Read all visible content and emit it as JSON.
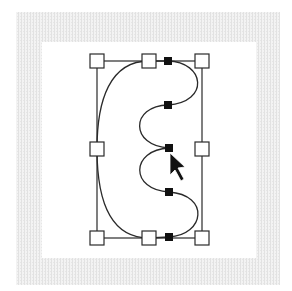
{
  "figure": {
    "colors": {
      "frame": "#ececec",
      "background": "#ffffff",
      "stroke": "#2a2a2a",
      "anchor": "#111111",
      "handle_fill": "#ffffff"
    },
    "frame": {
      "outer": [
        16,
        12,
        264,
        273
      ],
      "inner": [
        42,
        42,
        214,
        216
      ]
    },
    "bounding_box": {
      "x1": 97,
      "y1": 61,
      "x2": 202,
      "y2": 238
    },
    "handles": [
      {
        "name": "top-left",
        "x": 97,
        "y": 61
      },
      {
        "name": "top-middle",
        "x": 149,
        "y": 61
      },
      {
        "name": "top-right",
        "x": 202,
        "y": 61
      },
      {
        "name": "middle-left",
        "x": 97,
        "y": 149
      },
      {
        "name": "middle-right",
        "x": 202,
        "y": 149
      },
      {
        "name": "bottom-left",
        "x": 97,
        "y": 238
      },
      {
        "name": "bottom-middle",
        "x": 149,
        "y": 238
      },
      {
        "name": "bottom-right",
        "x": 202,
        "y": 238
      }
    ],
    "anchors": [
      {
        "x": 168,
        "y": 61
      },
      {
        "x": 168,
        "y": 105
      },
      {
        "x": 169,
        "y": 148
      },
      {
        "x": 169,
        "y": 192
      },
      {
        "x": 169,
        "y": 237
      }
    ],
    "cursor": {
      "tip_x": 170,
      "tip_y": 153,
      "type": "arrow-pointer"
    }
  }
}
